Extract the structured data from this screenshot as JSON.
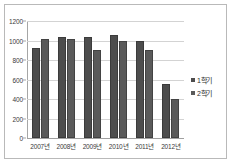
{
  "chart_data": {
    "type": "bar",
    "title": "",
    "xlabel": "",
    "ylabel": "",
    "categories": [
      "2007년",
      "2008년",
      "2009년",
      "2010년",
      "2011년",
      "2012년"
    ],
    "series": [
      {
        "name": "1학기",
        "values": [
          920,
          1035,
          1035,
          1060,
          990,
          550
        ],
        "color": "#4d4d4d"
      },
      {
        "name": "2학기",
        "values": [
          1015,
          1020,
          905,
          995,
          900,
          400
        ],
        "color": "#5a5a5a"
      }
    ],
    "ylim": [
      0,
      1200
    ],
    "yticks": [
      0,
      200,
      400,
      600,
      800,
      1000,
      1200
    ],
    "ytick_labels": [
      "0",
      "200",
      "400",
      "600",
      "800",
      "1000",
      "1200"
    ],
    "grid": true,
    "legend_position": "right",
    "border": true,
    "plot_background": "#ffffff",
    "gridline_color": "#d3d3d3",
    "axis_color": "#a6a6a6",
    "text_color": "#3a3a3a"
  }
}
